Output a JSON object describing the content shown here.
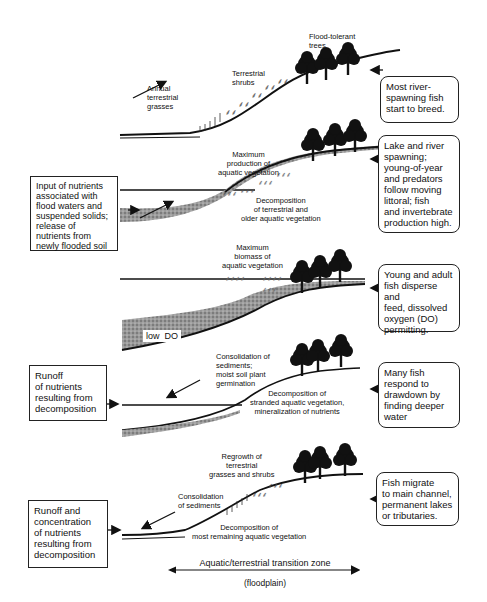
{
  "diagram": {
    "type": "floodplain flood-pulse stages",
    "panels": [
      {
        "id": 1,
        "labels": [
          "Annual\nterrestrial\ngrasses",
          "Terrestrial\nshrubs",
          "Flood-tolerant\ntrees"
        ],
        "right_note": "Most river-\nspawning fish\nstart to breed."
      },
      {
        "id": 2,
        "left_note": "Input of nutrients\nassociated with\nflood waters and\nsuspended solids;\nrelease of\nnutrients from\nnewly flooded soil",
        "labels": [
          "Maximum\nproduction of\naquatic vegetation",
          "Decomposition\nof terrestrial and\nolder aquatic vegetation"
        ],
        "right_note": "Lake and river\nspawning;\nyoung-of-year\nand predators\nfollow moving\nlittoral; fish\nand invertebrate\nproduction high."
      },
      {
        "id": 3,
        "labels": [
          "Maximum\nbiomass of\naquatic vegetation",
          "low  DO"
        ],
        "right_note": "Young and adult\nfish disperse and\nfeed, dissolved\noxygen (DO)\npermitting."
      },
      {
        "id": 4,
        "left_note": "Runoff\nof nutrients\nresulting from\ndecomposition",
        "labels": [
          "Consolidation of\nsediments;\nmoist soil plant\ngermination",
          "Decomposition of\nstranded aquatic vegetation,\nmineralization of nutrients"
        ],
        "right_note": "Many fish\nrespond to\ndrawdown by\nfinding deeper\nwater"
      },
      {
        "id": 5,
        "left_note": "Runoff and\nconcentration\nof nutrients\nresulting from\ndecomposition",
        "labels": [
          "Regrowth of\nterrestrial\ngrasses and shrubs",
          "Consolidation\nof sediments",
          "Decomposition of\nmost remaining aquatic vegetation"
        ],
        "right_note": "Fish migrate\nto main channel,\npermanent lakes\nor tributaries."
      }
    ],
    "axis": {
      "label": "Aquatic/terrestrial transition zone",
      "sublabel": "(floodplain)"
    }
  }
}
